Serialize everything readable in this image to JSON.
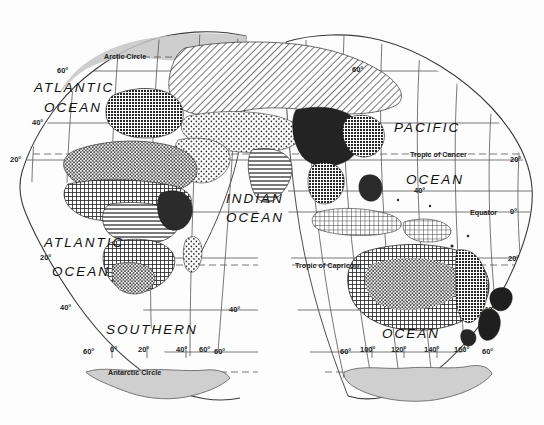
{
  "map": {
    "title": "World map — interrupted (Goode-style) projection, Eastern Hemisphere lobes",
    "projection": "interrupted-homolosine",
    "background_color": "#fdfdfd",
    "line_color": "#3a3a3a",
    "antarctica_fill": "#cfcfcf",
    "arctic_fill": "#c9c9c9",
    "ocean_labels": [
      {
        "id": "atlantic-north",
        "text": "ATLANTIC",
        "x": 36,
        "y": 88
      },
      {
        "id": "atlantic-north-ocean",
        "text": "OCEAN",
        "x": 44,
        "y": 108
      },
      {
        "id": "indian",
        "text": "INDIAN",
        "x": 228,
        "y": 199
      },
      {
        "id": "indian-ocean",
        "text": "OCEAN",
        "x": 228,
        "y": 218
      },
      {
        "id": "pacific",
        "text": "PACIFIC",
        "x": 398,
        "y": 128
      },
      {
        "id": "pacific-ocean",
        "text": "OCEAN",
        "x": 409,
        "y": 180
      },
      {
        "id": "atlantic-south",
        "text": "ATLANTIC",
        "x": 48,
        "y": 243
      },
      {
        "id": "atlantic-south-ocean",
        "text": "OCEAN",
        "x": 56,
        "y": 272
      },
      {
        "id": "southern",
        "text": "SOUTHERN",
        "x": 110,
        "y": 330
      },
      {
        "id": "southern-ocean",
        "text": "OCEAN",
        "x": 385,
        "y": 334
      }
    ],
    "special_lines": [
      {
        "id": "arctic-circle",
        "text": "Arctic Circle",
        "x": 104,
        "y": 56
      },
      {
        "id": "tropic-of-cancer",
        "text": "Tropic of Cancer",
        "x": 410,
        "y": 154
      },
      {
        "id": "equator",
        "text": "Equator",
        "x": 472,
        "y": 212
      },
      {
        "id": "tropic-of-capricorn",
        "text": "Tropic of Capricorn",
        "x": 297,
        "y": 265
      },
      {
        "id": "antarctic-circle",
        "text": "Antarctic Circle",
        "x": 110,
        "y": 372
      }
    ],
    "latitude_labels": [
      {
        "id": "lat-60n-left",
        "text": "60°",
        "x": 61,
        "y": 71
      },
      {
        "id": "lat-40n-left",
        "text": "40°",
        "x": 36,
        "y": 123
      },
      {
        "id": "lat-20n-left",
        "text": "20°",
        "x": 13,
        "y": 160
      },
      {
        "id": "lat-20s-left",
        "text": "20°",
        "x": 44,
        "y": 258
      },
      {
        "id": "lat-40s-left",
        "text": "40°",
        "x": 64,
        "y": 308
      },
      {
        "id": "lat-60n-right-lobe",
        "text": "60°",
        "x": 355,
        "y": 70
      },
      {
        "id": "lat-40n-pacific",
        "text": "40°",
        "x": 417,
        "y": 191
      },
      {
        "id": "lat-20n-right",
        "text": "20°",
        "x": 513,
        "y": 160
      },
      {
        "id": "lat-0-right",
        "text": "0°",
        "x": 512,
        "y": 212
      },
      {
        "id": "lat-20s-right",
        "text": "20°",
        "x": 512,
        "y": 259
      },
      {
        "id": "lat-40s-right",
        "text": "40°",
        "x": 487,
        "y": 310
      },
      {
        "id": "lat-40s-mid",
        "text": "40°",
        "x": 232,
        "y": 310
      }
    ],
    "longitude_labels_left_lobe": [
      {
        "id": "lon-60-left-edge",
        "text": "60°",
        "x": 86,
        "y": 352
      },
      {
        "id": "lon-0",
        "text": "0°",
        "x": 112,
        "y": 350
      },
      {
        "id": "lon-20",
        "text": "20°",
        "x": 140,
        "y": 350
      },
      {
        "id": "lon-40",
        "text": "40°",
        "x": 185,
        "y": 350
      },
      {
        "id": "lon-60",
        "text": "60°",
        "x": 196,
        "y": 350
      },
      {
        "id": "lon-60-right-edge",
        "text": "60°",
        "x": 210,
        "y": 352
      }
    ],
    "longitude_labels_right_lobe": [
      {
        "id": "lon-60-left-edge-r",
        "text": "60°",
        "x": 344,
        "y": 352
      },
      {
        "id": "lon-100",
        "text": "100°",
        "x": 362,
        "y": 350
      },
      {
        "id": "lon-120",
        "text": "120°",
        "x": 392,
        "y": 350
      },
      {
        "id": "lon-140",
        "text": "140°",
        "x": 425,
        "y": 350
      },
      {
        "id": "lon-160",
        "text": "160°",
        "x": 455,
        "y": 350
      },
      {
        "id": "lon-60-right-edge-r",
        "text": "60°",
        "x": 484,
        "y": 352
      }
    ],
    "pattern_legend_names": [
      "diagonal-hatch-tundra-boreal",
      "cross-hatch-temperate-forest",
      "dense-dot-desert",
      "fine-dot-steppe",
      "horizontal-line-grassland",
      "solid-dark-tropical-rainforest",
      "grid-check-mediterranean",
      "light-grey-ice"
    ]
  }
}
